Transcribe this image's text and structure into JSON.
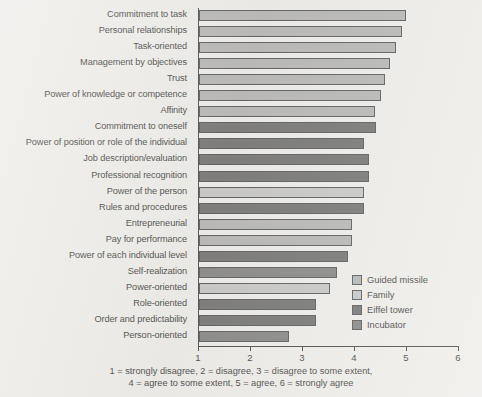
{
  "chart_data": {
    "type": "bar",
    "orientation": "horizontal",
    "title": "",
    "subtitle": "",
    "xlabel": "",
    "ylabel": "",
    "xlim": [
      1,
      6
    ],
    "xticks": [
      1,
      2,
      3,
      4,
      5,
      6
    ],
    "xtick_labels": [
      "1",
      "2",
      "3",
      "4",
      "5",
      "6"
    ],
    "grid": false,
    "legend_position": "inside-lower-right",
    "legend": [
      {
        "name": "Guided missile",
        "color": "#a9a9a9"
      },
      {
        "name": "Family",
        "color": "#bdbdbd"
      },
      {
        "name": "Eiffel tower",
        "color": "#5a5a5a"
      },
      {
        "name": "Incubator",
        "color": "#6f6f6f"
      }
    ],
    "categories": [
      "Commitment to task",
      "Personal relationships",
      "Task-oriented",
      "Management by objectives",
      "Trust",
      "Power of knowledge or competence",
      "Affinity",
      "Commitment to oneself",
      "Power of position or role of the individual",
      "Job description/evaluation",
      "Professional recognition",
      "Power of the person",
      "Rules and procedures",
      "Entrepreneurial",
      "Pay for performance",
      "Power of each individual level",
      "Self-realization",
      "Power-oriented",
      "Role-oriented",
      "Order and predictability",
      "Person-oriented"
    ],
    "values": [
      4.99,
      4.9,
      4.79,
      4.68,
      4.58,
      4.5,
      4.39,
      4.4,
      4.18,
      4.27,
      4.27,
      4.18,
      4.18,
      3.95,
      3.95,
      3.86,
      3.65,
      3.52,
      3.25,
      3.25,
      2.74
    ],
    "series_of_bar": [
      "Guided missile",
      "Guided missile",
      "Guided missile",
      "Guided missile",
      "Guided missile",
      "Guided missile",
      "Guided missile",
      "Eiffel tower",
      "Eiffel tower",
      "Eiffel tower",
      "Eiffel tower",
      "Family",
      "Eiffel tower",
      "Guided missile",
      "Guided missile",
      "Eiffel tower",
      "Incubator",
      "Family",
      "Eiffel tower",
      "Eiffel tower",
      "Incubator"
    ],
    "annotations": [
      "1 = strongly disagree, 2 = disagree, 3 = disagree to some extent,",
      "4 = agree to some extent, 5 = agree, 6 = strongly agree"
    ]
  },
  "caption": {
    "line1": "1 = strongly disagree, 2 = disagree, 3 = disagree to some extent,",
    "line2": "4 = agree to some extent, 5 = agree, 6 = strongly agree"
  }
}
